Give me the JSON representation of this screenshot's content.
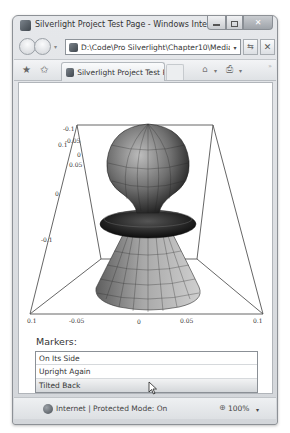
{
  "window": {
    "title": "Silverlight Project Test Page - Windows Internet Explo...",
    "controls": {
      "minimize": "",
      "maximize": "",
      "close": "✕"
    }
  },
  "navbar": {
    "address": "D:\\Code\\Pro Silverlight\\Chapter10\\Media\\Cl",
    "address_dropdown": "▾",
    "refresh_icon": "⇆",
    "stop_icon": "✕"
  },
  "commandbar": {
    "favorites_icon": "★",
    "add_favorites_icon": "✩",
    "tab_label": "Silverlight Project Test P...",
    "home_icon": "⌂",
    "print_icon": "⎙",
    "dropdown": "▾",
    "more": "»"
  },
  "plot": {
    "left_axis_ticks": [
      "-0.1",
      "-0.05",
      "0.1",
      "0",
      "0.05",
      "0",
      "-0.1"
    ],
    "bottom_axis_ticks": [
      "0.1",
      "-0.05",
      "0",
      "0.05",
      "0.1"
    ],
    "colors": {
      "frame": "#555555",
      "surface_dark": "#1a1a1a",
      "surface_mid": "#6e6e6e",
      "surface_light": "#bdbdbd"
    }
  },
  "markers": {
    "label": "Markers:",
    "items": [
      {
        "label": "On Its Side",
        "selected": false
      },
      {
        "label": "Upright Again",
        "selected": false
      },
      {
        "label": "Tilted Back",
        "selected": true
      }
    ]
  },
  "statusbar": {
    "zone": "Internet | Protected Mode: On",
    "zoom_icon": "🔍",
    "zoom": "100%",
    "zoom_dropdown": "▾"
  }
}
